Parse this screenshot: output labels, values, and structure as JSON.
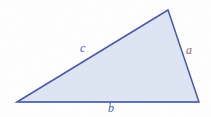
{
  "figure": {
    "type": "geometry-diagram",
    "shape": "triangle",
    "width": 211,
    "height": 117,
    "background_color": "#fefefe"
  },
  "triangle": {
    "fill_color": "#dde4f3",
    "stroke_color": "#4a5aa0",
    "base_stroke_color": "#5b6cb5",
    "stroke_width": 1.5,
    "vertices": [
      {
        "name": "left-vertex",
        "x": 17,
        "y": 102
      },
      {
        "name": "apex-vertex",
        "x": 168,
        "y": 10
      },
      {
        "name": "right-vertex",
        "x": 199,
        "y": 102
      }
    ],
    "points_attr": "17,102 168,10 199,102"
  },
  "labels": {
    "side_a": {
      "text": "a",
      "color": "#8d6a7a",
      "x": 186,
      "y": 44
    },
    "side_c": {
      "text": "c",
      "color": "#4f61ad",
      "x": 80,
      "y": 42
    },
    "side_b": {
      "text": "b",
      "color": "#4f61ad",
      "x": 108,
      "y": 102
    }
  }
}
